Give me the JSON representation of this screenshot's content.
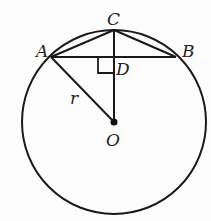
{
  "diagram": {
    "type": "circle-geometry",
    "labels": {
      "A": "A",
      "B": "B",
      "C": "C",
      "D": "D",
      "O": "O",
      "r": "r"
    },
    "points": {
      "A": [
        51,
        57
      ],
      "B": [
        176,
        57
      ],
      "C": [
        114,
        30
      ],
      "D": [
        114,
        57
      ],
      "O": [
        114,
        122
      ]
    },
    "circle": {
      "center": [
        114,
        122
      ],
      "radius": 92
    },
    "segments": [
      "AB",
      "AC",
      "CB",
      "CO",
      "AO"
    ],
    "right_angle_at": "D",
    "stroke_color": "#1a1a1a"
  }
}
